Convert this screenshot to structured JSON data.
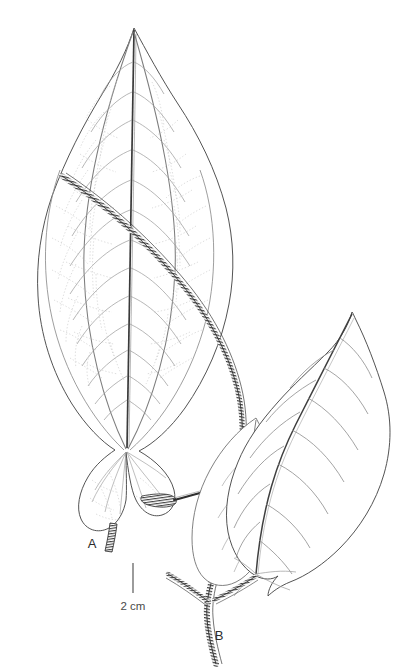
{
  "figure": {
    "type": "botanical-line-drawing",
    "background_color": "#ffffff",
    "ink_color": "#3a3a3a",
    "vein_color": "#8a8a8a",
    "reticulation_color": "#b9b9b9",
    "stem_color": "#2a2a2a"
  },
  "labels": [
    {
      "id": "a",
      "text": "A",
      "meaning": "upper cordate leaf with petiole",
      "x": 92,
      "y": 548
    },
    {
      "id": "b",
      "text": "B",
      "meaning": "branching pubescent stem node",
      "x": 219,
      "y": 640
    }
  ],
  "scale_bar": {
    "text": "2 cm",
    "length_px": 30,
    "orientation": "vertical",
    "x": 133,
    "y_top": 563,
    "y_bottom": 593,
    "label_x": 133,
    "label_y": 606
  },
  "elements": {
    "upper_leaf": {
      "name": "upper-leaf",
      "shape": "ovate-cordate, acuminate apex, deeply cordate base",
      "apex_x": 134,
      "apex_y": 28,
      "base_x": 126,
      "base_y": 450,
      "width_px": 198,
      "venation": "palmate-pinnate with reticulate tertiary veins"
    },
    "lower_leaf": {
      "name": "lower-right-leaf",
      "shape": "ovate, acuminate apex, cordate base",
      "apex_x": 352,
      "apex_y": 312,
      "base_x": 268,
      "base_y": 573,
      "venation": "pinnate"
    },
    "second_lower_leaf": {
      "name": "lower-left-leaf",
      "shape": "partially shown ovate leaf behind main lower leaf"
    },
    "stem": {
      "name": "pubescent-stem",
      "texture": "densely hairy, hatched",
      "start_x": 62,
      "start_y": 176,
      "end_x": 232,
      "end_y": 664
    },
    "petiole_a": {
      "name": "petiole-a",
      "texture": "hairy",
      "x": 108,
      "y": 536
    }
  }
}
